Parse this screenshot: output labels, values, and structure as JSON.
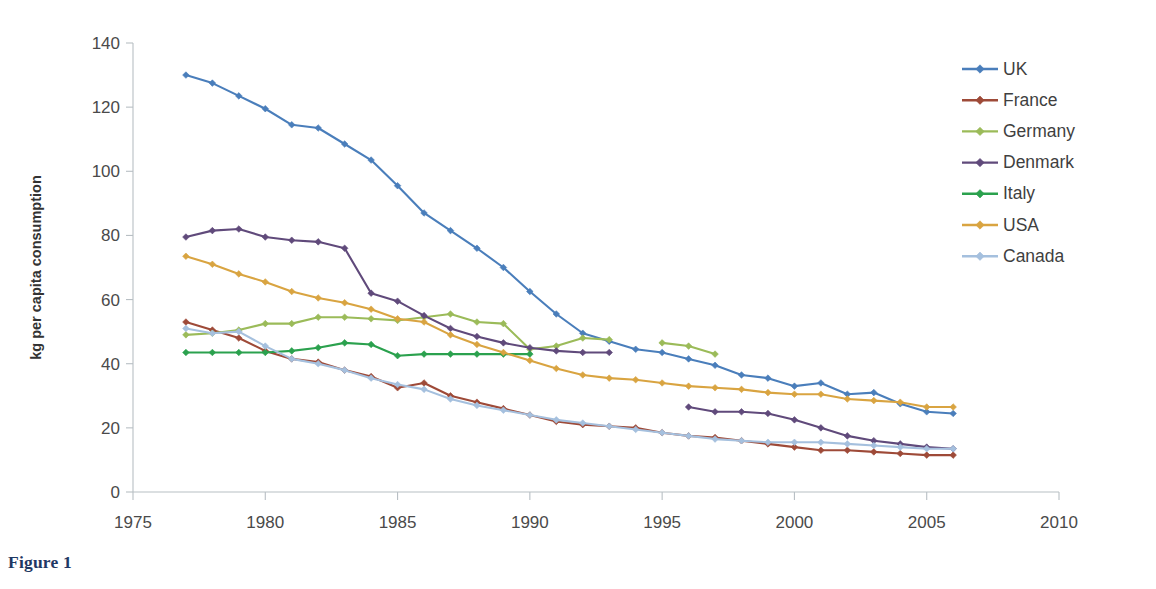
{
  "caption": "Figure 1",
  "chart_data": {
    "type": "line",
    "title": "",
    "xlabel": "",
    "ylabel": "kg per capita consumption",
    "xlim": [
      1975,
      2010
    ],
    "ylim": [
      0,
      140
    ],
    "xticks": [
      1975,
      1980,
      1985,
      1990,
      1995,
      2000,
      2005,
      2010
    ],
    "yticks": [
      0,
      20,
      40,
      60,
      80,
      100,
      120,
      140
    ],
    "xtick_labels": [
      "1975",
      "1980",
      "1985",
      "1990",
      "1995",
      "2000",
      "2005",
      "2010"
    ],
    "ytick_labels": [
      "0",
      "20",
      "40",
      "60",
      "80",
      "100",
      "120",
      "140"
    ],
    "grid": false,
    "legend_position": "right",
    "marker": "diamond",
    "series": [
      {
        "name": "UK",
        "color": "#4A7EBB",
        "x": [
          1977,
          1978,
          1979,
          1980,
          1981,
          1982,
          1983,
          1984,
          1985,
          1986,
          1987,
          1988,
          1989,
          1990,
          1991,
          1992,
          1993,
          1994,
          1995,
          1996,
          1997,
          1998,
          1999,
          2000,
          2001,
          2002,
          2003,
          2004,
          2005,
          2006
        ],
        "values": [
          130.0,
          127.5,
          123.5,
          119.5,
          114.5,
          113.5,
          108.5,
          103.5,
          95.5,
          87.0,
          81.5,
          76.0,
          70.0,
          62.5,
          55.5,
          49.5,
          47.0,
          44.5,
          43.5,
          41.5,
          39.5,
          36.5,
          35.5,
          33.0,
          34.0,
          30.5,
          31.0,
          27.5,
          25.0,
          24.5
        ]
      },
      {
        "name": "France",
        "color": "#9E4A38",
        "x": [
          1977,
          1978,
          1979,
          1980,
          1981,
          1982,
          1983,
          1984,
          1985,
          1986,
          1987,
          1988,
          1989,
          1990,
          1991,
          1992,
          1993,
          1994,
          1995,
          1996,
          1997,
          1998,
          1999,
          2000,
          2001,
          2002,
          2003,
          2004,
          2005,
          2006
        ],
        "values": [
          53.0,
          50.5,
          48.0,
          44.0,
          41.5,
          40.5,
          38.0,
          36.0,
          32.5,
          34.0,
          30.0,
          28.0,
          26.0,
          24.0,
          22.0,
          21.0,
          20.5,
          20.0,
          18.5,
          17.5,
          17.0,
          16.0,
          15.0,
          14.0,
          13.0,
          13.0,
          12.5,
          12.0,
          11.5,
          11.5
        ]
      },
      {
        "name": "Germany",
        "color": "#9BBB59",
        "x": [
          1977,
          1978,
          1979,
          1980,
          1981,
          1982,
          1983,
          1984,
          1985,
          1986,
          1987,
          1988,
          1989,
          1990,
          1991,
          1992,
          1993
        ],
        "values": [
          49.0,
          49.5,
          50.5,
          52.5,
          52.5,
          54.5,
          54.5,
          54.0,
          53.5,
          54.5,
          55.5,
          53.0,
          52.5,
          44.5,
          45.5,
          48.0,
          47.5
        ]
      },
      {
        "name": "Germany",
        "color": "#9BBB59",
        "x": [
          1995,
          1996,
          1997
        ],
        "values": [
          46.5,
          45.5,
          43.0
        ],
        "segment": 2
      },
      {
        "name": "Denmark",
        "color": "#604A7B",
        "x": [
          1977,
          1978,
          1979,
          1980,
          1981,
          1982,
          1983,
          1984,
          1985,
          1986,
          1987,
          1988,
          1989,
          1990,
          1991,
          1992,
          1993
        ],
        "values": [
          79.5,
          81.5,
          82.0,
          79.5,
          78.5,
          78.0,
          76.0,
          62.0,
          59.5,
          55.0,
          51.0,
          48.5,
          46.5,
          45.0,
          44.0,
          43.5,
          43.5
        ]
      },
      {
        "name": "Denmark",
        "color": "#604A7B",
        "x": [
          1996,
          1997,
          1998,
          1999,
          2000,
          2001,
          2002,
          2003,
          2004,
          2005,
          2006
        ],
        "values": [
          26.5,
          25.0,
          25.0,
          24.5,
          22.5,
          20.0,
          17.5,
          16.0,
          15.0,
          14.0,
          13.5
        ],
        "segment": 2
      },
      {
        "name": "Italy",
        "color": "#2BA14E",
        "x": [
          1977,
          1978,
          1979,
          1980,
          1981,
          1982,
          1983,
          1984,
          1985,
          1986,
          1987,
          1988,
          1989,
          1990
        ],
        "values": [
          43.5,
          43.5,
          43.5,
          43.5,
          44.0,
          45.0,
          46.5,
          46.0,
          42.5,
          43.0,
          43.0,
          43.0,
          43.0,
          43.0
        ]
      },
      {
        "name": "USA",
        "color": "#D9A441",
        "x": [
          1977,
          1978,
          1979,
          1980,
          1981,
          1982,
          1983,
          1984,
          1985,
          1986,
          1987,
          1988,
          1989,
          1990,
          1991,
          1992,
          1993,
          1994,
          1995,
          1996,
          1997,
          1998,
          1999,
          2000,
          2001,
          2002,
          2003,
          2004,
          2005,
          2006
        ],
        "values": [
          73.5,
          71.0,
          68.0,
          65.5,
          62.5,
          60.5,
          59.0,
          57.0,
          54.0,
          53.0,
          49.0,
          46.0,
          43.5,
          41.0,
          38.5,
          36.5,
          35.5,
          35.0,
          34.0,
          33.0,
          32.5,
          32.0,
          31.0,
          30.5,
          30.5,
          29.0,
          28.5,
          28.0,
          26.5,
          26.5
        ]
      },
      {
        "name": "Canada",
        "color": "#A5C0DE",
        "x": [
          1977,
          1978,
          1979,
          1980,
          1981,
          1982,
          1983,
          1984,
          1985,
          1986,
          1987,
          1988,
          1989,
          1990,
          1991,
          1992,
          1993,
          1994,
          1995,
          1996,
          1997,
          1998,
          1999,
          2000,
          2001,
          2002,
          2003,
          2004,
          2005,
          2006
        ],
        "values": [
          51.0,
          49.5,
          50.0,
          45.5,
          41.5,
          40.0,
          38.0,
          35.5,
          33.5,
          32.0,
          29.0,
          27.0,
          25.5,
          24.0,
          22.5,
          21.5,
          20.5,
          19.5,
          18.5,
          17.5,
          16.5,
          16.0,
          15.5,
          15.5,
          15.5,
          15.0,
          14.5,
          14.0,
          13.5,
          13.5
        ]
      }
    ],
    "legend": [
      {
        "label": "UK",
        "color": "#4A7EBB"
      },
      {
        "label": "France",
        "color": "#9E4A38"
      },
      {
        "label": "Germany",
        "color": "#9BBB59"
      },
      {
        "label": "Denmark",
        "color": "#604A7B"
      },
      {
        "label": "Italy",
        "color": "#2BA14E"
      },
      {
        "label": "USA",
        "color": "#D9A441"
      },
      {
        "label": "Canada",
        "color": "#A5C0DE"
      }
    ]
  }
}
